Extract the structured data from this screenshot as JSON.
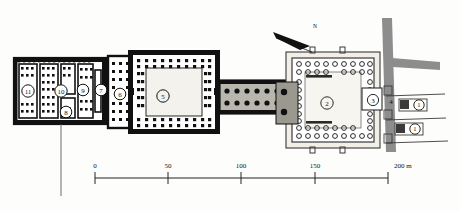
{
  "figure": {
    "kind": "archaeological-site-plan",
    "north_arrow_label": "N",
    "background_color": "#fdfdfc",
    "ink_color": "#111111",
    "wall_fill": "#000000",
    "street_fill": "#8d8d8d",
    "courtyard_fill": "#f4f2ec"
  },
  "scale_bar": {
    "unit_label": "200 m",
    "ticks": [
      "0",
      "50",
      "100",
      "150",
      "200"
    ],
    "tick_values": [
      0,
      50,
      100,
      150,
      200
    ],
    "x_start_px": 95,
    "x_end_px": 388,
    "y_px": 178
  },
  "buildings": [
    {
      "id": "west-complex",
      "labels": [
        "11",
        "10",
        "9",
        "8",
        "7"
      ],
      "description": "western multi-room block with piers"
    },
    {
      "id": "hypostyle-hall",
      "labels": [
        "6"
      ],
      "description": "dense columned hall"
    },
    {
      "id": "great-courtyard",
      "labels": [
        "5"
      ],
      "description": "large peristyle courtyard with column rows"
    },
    {
      "id": "colonnaded-corridor",
      "labels": [],
      "description": "double row of columns linking courtyards"
    },
    {
      "id": "east-courtyard",
      "labels": [
        "2",
        "3"
      ],
      "description": "eastern court with open-circle columns"
    },
    {
      "id": "east-annex",
      "labels": [
        "4"
      ],
      "description": "narrow annex along the street"
    },
    {
      "id": "east-houses",
      "labels": [
        "1",
        "1"
      ],
      "description": "small structures east of the street"
    }
  ],
  "room_labels": [
    {
      "text": "11",
      "x": 28,
      "y": 94
    },
    {
      "text": "10",
      "x": 61,
      "y": 94
    },
    {
      "text": "9",
      "x": 83,
      "y": 93
    },
    {
      "text": "8",
      "x": 66,
      "y": 114
    },
    {
      "text": "7",
      "x": 103,
      "y": 93
    },
    {
      "text": "6",
      "x": 120,
      "y": 97
    },
    {
      "text": "5",
      "x": 163,
      "y": 99
    },
    {
      "text": "2",
      "x": 327,
      "y": 106
    },
    {
      "text": "3",
      "x": 375,
      "y": 103
    },
    {
      "text": "4",
      "x": 393,
      "y": 105
    },
    {
      "text": "1",
      "x": 421,
      "y": 107
    },
    {
      "text": "1",
      "x": 417,
      "y": 131
    }
  ]
}
